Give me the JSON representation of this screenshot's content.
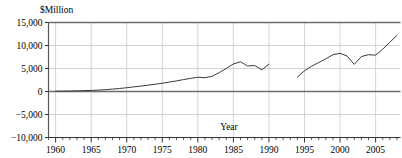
{
  "chart_data": {
    "type": "line",
    "title": "",
    "subtitle": "",
    "xlabel": "Year",
    "ylabel": "$Million",
    "ylabel_position": "top-left",
    "xlim": [
      1959,
      2008.5
    ],
    "ylim": [
      -10000,
      15000
    ],
    "y_ticks": [
      -10000,
      -5000,
      0,
      5000,
      10000,
      15000
    ],
    "y_tick_labels": [
      "−10,000",
      "−5,000",
      "0",
      "5,000",
      "10,000",
      "15,000"
    ],
    "x_ticks": [
      1960,
      1965,
      1970,
      1975,
      1980,
      1985,
      1990,
      1995,
      2000,
      2005
    ],
    "x_tick_labels": [
      "1960",
      "1965",
      "1970",
      "1975",
      "1980",
      "1985",
      "1990",
      "1995",
      "2000",
      "2005"
    ],
    "x_minor_tick_step": 1,
    "grid": {
      "horizontal": true,
      "vertical": true,
      "vertical_at": [
        1960,
        1965,
        1970,
        1975,
        1980,
        1985,
        1990,
        1995,
        2000,
        2005
      ],
      "color": "#c9c9c9"
    },
    "zero_line": {
      "value": 0,
      "color": "#6b6b6b"
    },
    "legend": {
      "visible": false,
      "position": "none"
    },
    "line_color": "#3a3a3a",
    "line_width": 1.0,
    "series": [
      {
        "name": "series-1",
        "x": [
          1960,
          1961,
          1962,
          1963,
          1964,
          1965,
          1966,
          1967,
          1968,
          1969,
          1970,
          1971,
          1972,
          1973,
          1974,
          1975,
          1976,
          1977,
          1978,
          1979,
          1980,
          1981,
          1982,
          1983,
          1984,
          1985,
          1986,
          1987,
          1988,
          1989,
          1990
        ],
        "values": [
          60,
          80,
          110,
          140,
          180,
          230,
          300,
          400,
          520,
          660,
          820,
          1000,
          1180,
          1380,
          1580,
          1800,
          2050,
          2300,
          2600,
          2850,
          3100,
          3000,
          3300,
          4100,
          5000,
          6000,
          6450,
          5550,
          5650,
          4700,
          5950
        ]
      },
      {
        "name": "series-2",
        "x": [
          1994,
          1995,
          1996,
          1997,
          1998,
          1999,
          2000,
          2001,
          2002,
          2003,
          2004,
          2005,
          2006,
          2007,
          2008
        ],
        "values": [
          3150,
          4500,
          5500,
          6300,
          7100,
          8000,
          8300,
          7700,
          5900,
          7600,
          8000,
          7900,
          9200,
          10700,
          12200
        ]
      }
    ]
  },
  "axis_titles": {
    "y": "$Million",
    "x": "Year"
  }
}
